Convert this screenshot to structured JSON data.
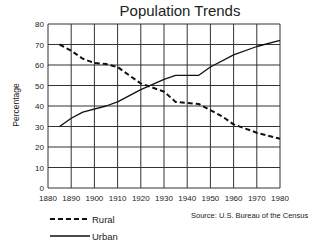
{
  "chart_data": {
    "type": "line",
    "title": "Population Trends",
    "xlabel": "",
    "ylabel": "Percentage",
    "xlim": [
      1880,
      1980
    ],
    "ylim": [
      0,
      80
    ],
    "x_ticks": [
      1880,
      1890,
      1900,
      1910,
      1920,
      1930,
      1940,
      1950,
      1960,
      1970,
      1980
    ],
    "y_ticks": [
      0,
      10,
      20,
      30,
      40,
      50,
      60,
      70,
      80
    ],
    "grid": true,
    "legend_position": "bottom-left",
    "series": [
      {
        "name": "Rural",
        "style": "dashed",
        "x": [
          1885,
          1890,
          1895,
          1900,
          1905,
          1910,
          1920,
          1930,
          1935,
          1945,
          1950,
          1955,
          1960,
          1970,
          1980
        ],
        "values": [
          70,
          67,
          63,
          61,
          60.5,
          59,
          51,
          47,
          42,
          41,
          38,
          35,
          31,
          27,
          24
        ]
      },
      {
        "name": "Urban",
        "style": "solid",
        "x": [
          1885,
          1890,
          1895,
          1905,
          1910,
          1920,
          1930,
          1935,
          1945,
          1950,
          1960,
          1970,
          1980
        ],
        "values": [
          30,
          34,
          37,
          40,
          42,
          48,
          53,
          55,
          55,
          59,
          65,
          69,
          72
        ]
      }
    ],
    "annotations": [
      "Source: U.S. Bureau of the Census"
    ]
  },
  "title": "Population Trends",
  "ylabel": "Percentage",
  "legend": {
    "rural": "Rural",
    "urban": "Urban"
  },
  "source": "Source: U.S. Bureau of the Census"
}
